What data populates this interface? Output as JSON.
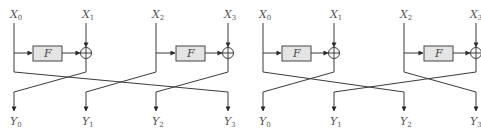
{
  "colors": {
    "wire": "#3a3a3a",
    "fbox_fill": "#e4e4e4",
    "label": "#555555"
  },
  "diagrams": [
    {
      "name": "left-network",
      "inputs": [
        {
          "base": "X",
          "sub": "0"
        },
        {
          "base": "X",
          "sub": "1"
        },
        {
          "base": "X",
          "sub": "2"
        },
        {
          "base": "X",
          "sub": "3"
        }
      ],
      "outputs": [
        {
          "base": "Y",
          "sub": "0"
        },
        {
          "base": "Y",
          "sub": "1"
        },
        {
          "base": "Y",
          "sub": "2"
        },
        {
          "base": "Y",
          "sub": "3"
        }
      ],
      "functions": [
        {
          "label": "F"
        },
        {
          "label": "F"
        }
      ],
      "permutation": {
        "X0": "Y3",
        "X1^F(X0)": "Y0",
        "X2": "Y1",
        "X3^F(X2)": "Y2"
      }
    },
    {
      "name": "right-network",
      "inputs": [
        {
          "base": "X",
          "sub": "0"
        },
        {
          "base": "X",
          "sub": "1"
        },
        {
          "base": "X",
          "sub": "2"
        },
        {
          "base": "X",
          "sub": "3"
        }
      ],
      "outputs": [
        {
          "base": "Y",
          "sub": "0"
        },
        {
          "base": "Y",
          "sub": "1"
        },
        {
          "base": "Y",
          "sub": "2"
        },
        {
          "base": "Y",
          "sub": "3"
        }
      ],
      "functions": [
        {
          "label": "F"
        },
        {
          "label": "F"
        }
      ],
      "permutation": {
        "X0": "Y2",
        "X1^F(X0)": "Y0",
        "X2": "Y3",
        "X3^F(X2)": "Y1"
      }
    }
  ]
}
